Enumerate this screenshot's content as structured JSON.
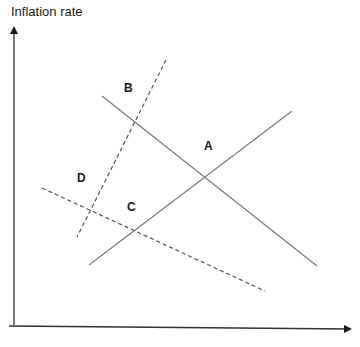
{
  "diagram": {
    "y_axis_label": "Inflation rate",
    "x_axis_label": "",
    "colors": {
      "axis": "#333333",
      "curve": "#7a7a7a",
      "dashed_curve": "#555555",
      "text": "#1a1a1a"
    },
    "curves": [
      {
        "id": "curve-downward-solid",
        "style": "solid",
        "slope": "downward"
      },
      {
        "id": "curve-upward-solid",
        "style": "solid",
        "slope": "upward"
      },
      {
        "id": "curve-steep-dashed",
        "style": "dashed",
        "slope": "upward-steep"
      },
      {
        "id": "curve-shallow-dashed",
        "style": "dashed",
        "slope": "downward-shallow"
      }
    ],
    "points": [
      {
        "label": "A"
      },
      {
        "label": "B"
      },
      {
        "label": "C"
      },
      {
        "label": "D"
      }
    ]
  }
}
